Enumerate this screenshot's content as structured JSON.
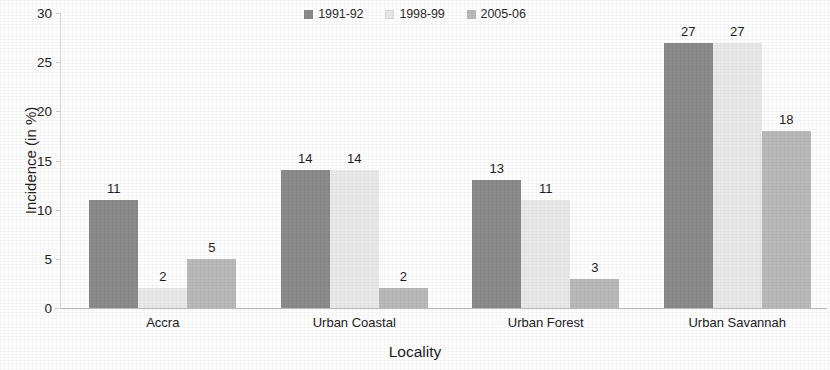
{
  "chart_data": {
    "type": "bar",
    "title": "",
    "xlabel": "Locality",
    "ylabel": "Incidence (in %)",
    "categories": [
      "Accra",
      "Urban Coastal",
      "Urban Forest",
      "Urban Savannah"
    ],
    "series": [
      {
        "name": "1991-92",
        "values": [
          11,
          14,
          13,
          27
        ],
        "color": "#8a8a8a"
      },
      {
        "name": "1998-99",
        "values": [
          2,
          14,
          11,
          27
        ],
        "color": "#e9e9e9"
      },
      {
        "name": "2005-06",
        "values": [
          5,
          2,
          3,
          18
        ],
        "color": "#b9b9b9"
      }
    ],
    "ylim": [
      0,
      30
    ],
    "yticks": [
      "0",
      "5",
      "10",
      "15",
      "20",
      "25",
      "30"
    ],
    "grid": false,
    "legend_position": "top-center",
    "data_labels": true
  }
}
